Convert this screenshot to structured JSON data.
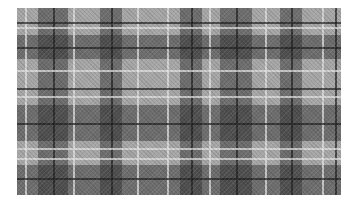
{
  "image": {
    "description": "Grayscale tartan plaid fabric pattern",
    "colors": {
      "base": "#a6a6a6",
      "dark_band": "#404040",
      "light_line": "#e1e1e1",
      "dark_line": "#1e1e1e",
      "background": "#ffffff"
    },
    "bounds": {
      "x": 17,
      "y": 8,
      "width": 324,
      "height": 187
    },
    "vertical_bands": [
      {
        "x": 21,
        "w": 30
      },
      {
        "x": 83,
        "w": 22
      },
      {
        "x": 163,
        "w": 22
      },
      {
        "x": 203,
        "w": 32
      },
      {
        "x": 263,
        "w": 22
      }
    ],
    "horizontal_bands": [
      {
        "y": 27,
        "h": 24
      },
      {
        "y": 97,
        "h": 36
      },
      {
        "y": 157,
        "h": 30
      }
    ],
    "vertical_light_lines": [
      8,
      56,
      120,
      150,
      192,
      248,
      305
    ],
    "vertical_dark_lines": [
      36,
      94,
      174,
      219,
      274,
      318
    ],
    "horizontal_light_lines": [
      19,
      62,
      88,
      140,
      150
    ],
    "horizontal_dark_lines": [
      14,
      39,
      80,
      115,
      170
    ]
  }
}
